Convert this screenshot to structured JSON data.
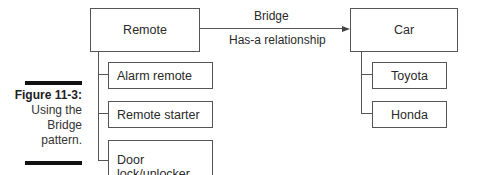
{
  "figure": {
    "number": "Figure 11-3:",
    "caption_lines": [
      "Using the",
      "Bridge",
      "pattern."
    ]
  },
  "diagram": {
    "abstraction": {
      "label": "Remote",
      "subclasses": [
        "Alarm remote",
        "Remote starter",
        "Door lock/unlocker"
      ]
    },
    "implementor": {
      "label": "Car",
      "subclasses": [
        "Toyota",
        "Honda"
      ]
    },
    "relationship": {
      "top_label": "Bridge",
      "bottom_label": "Has-a relationship"
    }
  }
}
